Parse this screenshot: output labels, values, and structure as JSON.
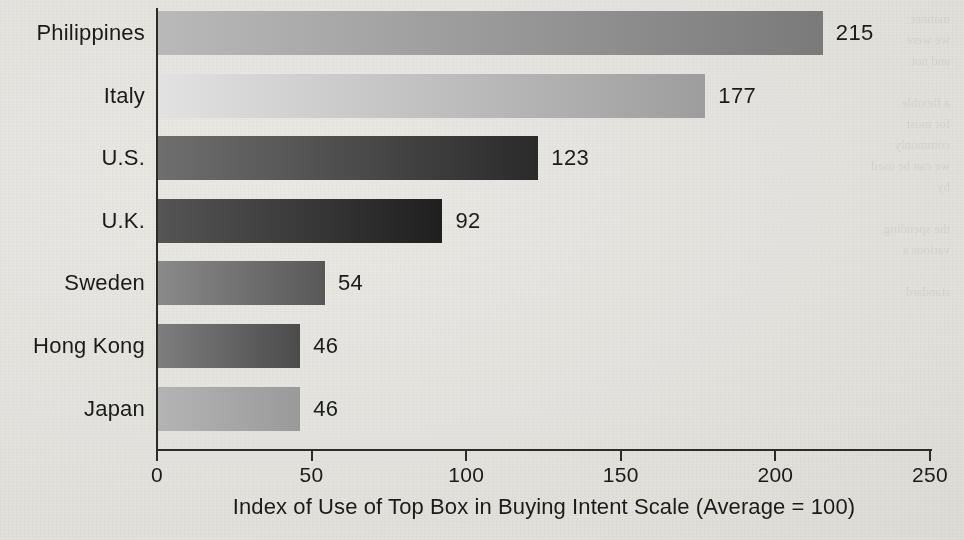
{
  "figure": {
    "background_color": "#f2f1ee",
    "ink_color": "#1b1b1b",
    "ghost_text": "manner\nwe were\nand not\n\na flexible\nfor most\ncommonly\nwe can be used\nby\n\nthe spending\nvarious a\n\nstandard"
  },
  "axis": {
    "title": "Index of Use of Top Box in Buying Intent Scale (Average = 100)",
    "tick_labels": [
      "0",
      "50",
      "100",
      "150",
      "200",
      "250"
    ],
    "tick_values": [
      0,
      50,
      100,
      150,
      200,
      250
    ]
  },
  "chart_data": {
    "type": "bar",
    "orientation": "horizontal",
    "title": "",
    "xlabel": "Index of Use of Top Box in Buying Intent Scale (Average = 100)",
    "ylabel": "",
    "xlim": [
      0,
      250
    ],
    "xticks": [
      0,
      50,
      100,
      150,
      200,
      250
    ],
    "grid": false,
    "legend": null,
    "categories": [
      "Philippines",
      "Italy",
      "U.S.",
      "U.K.",
      "Sweden",
      "Hong Kong",
      "Japan"
    ],
    "values": [
      215,
      177,
      123,
      92,
      54,
      46,
      46
    ],
    "value_labels": [
      "215",
      "177",
      "123",
      "92",
      "54",
      "46",
      "46"
    ],
    "bars": [
      {
        "category": "Philippines",
        "value": 215,
        "label": "215",
        "gradient_from": "#b9b9b9",
        "gradient_to": "#7a7a7a"
      },
      {
        "category": "Italy",
        "value": 177,
        "label": "177",
        "gradient_from": "#e2e2e2",
        "gradient_to": "#9d9d9d"
      },
      {
        "category": "U.S.",
        "value": 123,
        "label": "123",
        "gradient_from": "#6f6f6f",
        "gradient_to": "#2a2a2a"
      },
      {
        "category": "U.K.",
        "value": 92,
        "label": "92",
        "gradient_from": "#555555",
        "gradient_to": "#1f1f1f"
      },
      {
        "category": "Sweden",
        "value": 54,
        "label": "54",
        "gradient_from": "#8a8a8a",
        "gradient_to": "#585858"
      },
      {
        "category": "Hong Kong",
        "value": 46,
        "label": "46",
        "gradient_from": "#7e7e7e",
        "gradient_to": "#4b4b4b"
      },
      {
        "category": "Japan",
        "value": 46,
        "label": "46",
        "gradient_from": "#b4b4b4",
        "gradient_to": "#9a9a9a"
      }
    ]
  }
}
